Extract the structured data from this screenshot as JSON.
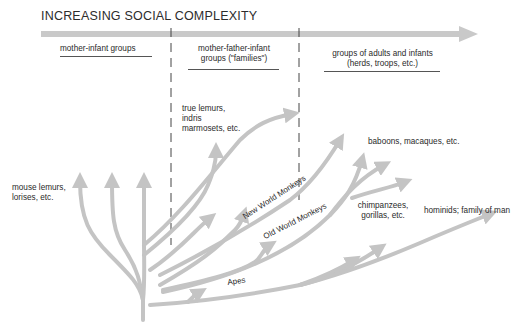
{
  "title": "INCREASING SOCIAL COMPLEXITY",
  "stages": [
    {
      "label": "mother-infant groups"
    },
    {
      "label_line1": "mother-father-infant",
      "label_line2": "groups (\"families\")"
    },
    {
      "label_line1": "groups of adults and infants",
      "label_line2": "(herds, troops, etc.)"
    }
  ],
  "taxa": {
    "mouse_lemurs_line1": "mouse lemurs,",
    "mouse_lemurs_line2": "lorises,  etc.",
    "true_lemurs_line1": "true lemurs,",
    "true_lemurs_line2": "indris",
    "true_lemurs_line3": "marmosets, etc.",
    "baboons": "baboons, macaques, etc.",
    "chimps_line1": "chimpanzees,",
    "chimps_line2": "gorillas, etc.",
    "hominids": "hominids; family of man"
  },
  "branch_labels": {
    "new_world": "New World Monkeys",
    "old_world": "Old World Monkeys",
    "apes": "Apes"
  },
  "colors": {
    "arrow": "#c4c4c4",
    "text": "#2a2a2a",
    "divider": "#444444"
  }
}
